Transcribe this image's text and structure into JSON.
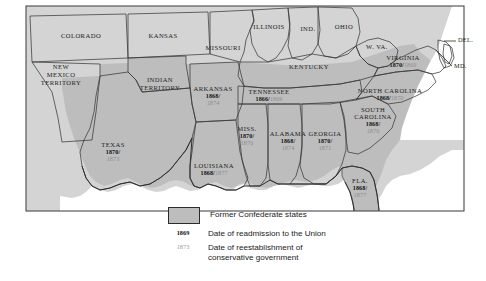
{
  "figure": {
    "type": "thematic-map"
  },
  "colors": {
    "confederate_fill": "#bdbdbd",
    "other_fill": "#d4d4d4",
    "water_fill": "#ffffff",
    "border_stroke": "#3a3a3a",
    "readmission_text": "#111111",
    "conservative_text": "#8b8b8b"
  },
  "legend": {
    "swatch_label": "Former Confederate states",
    "readmission_key": "1869",
    "readmission_label": "Date of readmission to the Union",
    "conservative_key": "1873",
    "conservative_label_line1": "Date of reestablishment of",
    "conservative_label_line2": "conservative government"
  },
  "confederate_states": [
    {
      "name": "TEXAS",
      "readmission": "1870/",
      "conservative": "1873"
    },
    {
      "name": "ARKANSAS",
      "readmission": "1868/",
      "conservative": "1874"
    },
    {
      "name": "LOUISIANA",
      "readmission": "1868/",
      "conservative": "1877",
      "inline": true
    },
    {
      "name": "MISS.",
      "readmission": "1870/",
      "conservative": "1876"
    },
    {
      "name": "ALABAMA",
      "readmission": "1868/",
      "conservative": "1874"
    },
    {
      "name": "GEORGIA",
      "readmission": "1870/",
      "conservative": "1871"
    },
    {
      "name": "FLA.",
      "readmission": "1868/",
      "conservative": "1877"
    },
    {
      "name": "TENNESSEE",
      "readmission": "1866/",
      "conservative": "1869",
      "inline": true
    },
    {
      "name": "SOUTH CAROLINA",
      "readmission": "1868/",
      "conservative": "1876"
    },
    {
      "name": "NORTH CAROLINA",
      "readmission": "1868/",
      "conservative": "1870",
      "inline": true
    },
    {
      "name": "VIRGINIA",
      "readmission": "1870/",
      "conservative": "1869",
      "inline": true
    }
  ],
  "other_labels": [
    {
      "name": "COLORADO"
    },
    {
      "name": "KANSAS"
    },
    {
      "name": "MISSOURI"
    },
    {
      "name": "ILLINOIS"
    },
    {
      "name": "IND."
    },
    {
      "name": "OHIO"
    },
    {
      "name": "W. VA."
    },
    {
      "name": "KENTUCKY"
    },
    {
      "name": "NEW MEXICO TERRITORY",
      "lines": [
        "NEW",
        "MEXICO",
        "TERRITORY"
      ]
    },
    {
      "name": "INDIAN TERRITORY",
      "lines": [
        "INDIAN",
        "TERRITORY"
      ]
    },
    {
      "name": "DEL."
    },
    {
      "name": "MD."
    }
  ]
}
